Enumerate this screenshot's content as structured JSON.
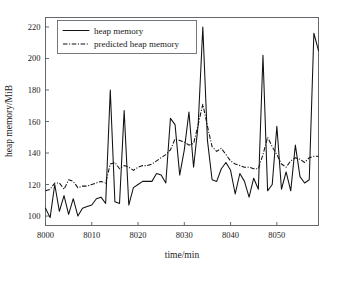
{
  "figure": {
    "background_color": "#ffffff",
    "line_color": "#111111",
    "frame_color": "#555a5e"
  },
  "chart_data": {
    "type": "line",
    "title": "",
    "xlabel": "time/min",
    "ylabel": "heap memory/MiB",
    "xlim": [
      8000,
      8059
    ],
    "ylim": [
      94,
      226
    ],
    "xticks": [
      8000,
      8010,
      8020,
      8030,
      8040,
      8050
    ],
    "yticks": [
      100,
      120,
      140,
      160,
      180,
      200,
      220
    ],
    "grid": false,
    "legend_position": "upper-left",
    "legend": [
      "heap memory",
      "predicted heap memory"
    ],
    "x": [
      8000,
      8001,
      8002,
      8003,
      8004,
      8005,
      8006,
      8007,
      8008,
      8009,
      8010,
      8011,
      8012,
      8013,
      8014,
      8015,
      8016,
      8017,
      8018,
      8019,
      8020,
      8021,
      8022,
      8023,
      8024,
      8025,
      8026,
      8027,
      8028,
      8029,
      8030,
      8031,
      8032,
      8033,
      8034,
      8035,
      8036,
      8037,
      8038,
      8039,
      8040,
      8041,
      8042,
      8043,
      8044,
      8045,
      8046,
      8047,
      8048,
      8049,
      8050,
      8051,
      8052,
      8053,
      8054,
      8055,
      8056,
      8057,
      8058,
      8059
    ],
    "series": [
      {
        "name": "heap memory",
        "style": "solid",
        "values": [
          105,
          99,
          120,
          103,
          113,
          101,
          111,
          100,
          105,
          106,
          107,
          111,
          112,
          108,
          180,
          109,
          108,
          167,
          107,
          118,
          120,
          122,
          122,
          122,
          127,
          126,
          121,
          162,
          158,
          126,
          142,
          166,
          131,
          158,
          220,
          148,
          123,
          122,
          130,
          134,
          129,
          114,
          127,
          122,
          112,
          124,
          117,
          202,
          116,
          120,
          157,
          117,
          128,
          116,
          145,
          125,
          121,
          123,
          216,
          205
        ]
      },
      {
        "name": "predicted heap memory",
        "style": "dash-dot",
        "values": [
          116,
          117,
          121,
          121,
          117,
          123,
          122,
          118,
          119,
          119,
          120,
          121,
          122,
          121,
          133,
          134,
          130,
          132,
          131,
          129,
          131,
          132,
          132,
          133,
          135,
          137,
          139,
          142,
          149,
          148,
          147,
          145,
          146,
          158,
          171,
          157,
          144,
          141,
          143,
          139,
          135,
          133,
          132,
          131,
          131,
          130,
          130,
          139,
          150,
          144,
          139,
          133,
          131,
          135,
          137,
          136,
          134,
          137,
          138,
          138
        ]
      }
    ]
  }
}
